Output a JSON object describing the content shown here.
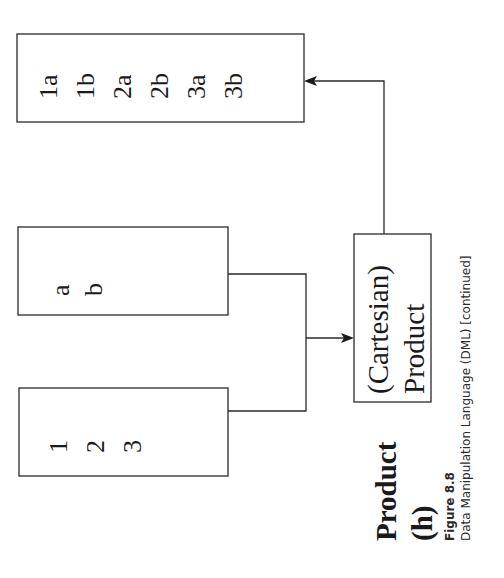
{
  "diagram": {
    "operation_label": "Product",
    "operation_letter": "(h)",
    "input_table_1": {
      "values": [
        "1",
        "2",
        "3"
      ]
    },
    "input_table_2": {
      "values": [
        "a",
        "b"
      ]
    },
    "operator_box": {
      "line1": "(Cartesian)",
      "line2": "Product"
    },
    "result_table": {
      "values": [
        "1a",
        "1b",
        "2a",
        "2b",
        "3a",
        "3b"
      ]
    },
    "orientation": "rotated 90° counter-clockwise",
    "colors": {
      "stroke": "#2a2a2a",
      "text": "#1a1a1a",
      "background": "#ffffff"
    }
  },
  "caption": {
    "figure_number": "Figure 8.8",
    "text": "Data Manipulation Language (DML) [continued]"
  }
}
